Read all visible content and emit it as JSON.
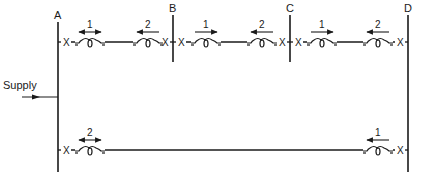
{
  "diagram": {
    "colors": {
      "line": "#1a1a1a",
      "background": "#ffffff"
    },
    "supply": {
      "label": "Supply",
      "direction": "right",
      "y": 97
    },
    "buses": [
      {
        "id": "A",
        "label": "A",
        "x": 58,
        "y1": 22,
        "y2": 172
      },
      {
        "id": "B",
        "label": "B",
        "x": 173,
        "y1": 15,
        "y2": 62
      },
      {
        "id": "C",
        "label": "C",
        "x": 290,
        "y1": 15,
        "y2": 62
      },
      {
        "id": "D",
        "label": "D",
        "x": 408,
        "y1": 15,
        "y2": 172
      }
    ],
    "lines": [
      {
        "id": "top",
        "y": 42
      },
      {
        "id": "bottom",
        "y": 150
      }
    ],
    "breaker_symbol": "X",
    "relays": [
      {
        "id": "r-AB-1",
        "section": "A-B",
        "label": "1",
        "x": 90,
        "y": 42,
        "arrow": "both"
      },
      {
        "id": "r-AB-2",
        "section": "A-B",
        "label": "2",
        "x": 148,
        "y": 42,
        "arrow": "left"
      },
      {
        "id": "r-BC-1",
        "section": "B-C",
        "label": "1",
        "x": 206,
        "y": 42,
        "arrow": "right"
      },
      {
        "id": "r-BC-2",
        "section": "B-C",
        "label": "2",
        "x": 262,
        "y": 42,
        "arrow": "left"
      },
      {
        "id": "r-CD-1",
        "section": "C-D",
        "label": "1",
        "x": 322,
        "y": 42,
        "arrow": "right"
      },
      {
        "id": "r-CD-2",
        "section": "C-D",
        "label": "2",
        "x": 378,
        "y": 42,
        "arrow": "left"
      },
      {
        "id": "r-AD-2",
        "section": "A-D",
        "label": "2",
        "x": 90,
        "y": 150,
        "arrow": "both"
      },
      {
        "id": "r-AD-1",
        "section": "A-D",
        "label": "1",
        "x": 378,
        "y": 150,
        "arrow": "left"
      }
    ]
  }
}
